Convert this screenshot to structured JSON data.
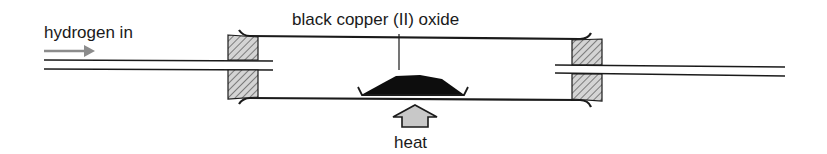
{
  "diagram": {
    "labels": {
      "inlet": "hydrogen in",
      "substance": "black copper (II) oxide",
      "heat": "heat"
    },
    "colors": {
      "line": "#1a1a1a",
      "arrow_gray": "#8c8c8c",
      "heat_arrow_fill": "#c8c8c8",
      "stopper_fill": "#d0d0d0",
      "oxide": "#0d0d0d"
    },
    "components": [
      "inlet-arrow",
      "inlet-tube",
      "left-stopper",
      "combustion-tube",
      "porcelain-boat",
      "right-stopper",
      "outlet-tube",
      "heat-arrow"
    ]
  }
}
